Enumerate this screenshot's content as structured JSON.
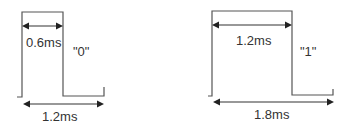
{
  "diagrams": [
    {
      "bit_label": "\"0\"",
      "high_duration_label": "0.6ms",
      "period_label": "1.2ms",
      "high_duration_ms": 0.6,
      "period_ms": 1.2
    },
    {
      "bit_label": "\"1\"",
      "high_duration_label": "1.2ms",
      "period_label": "1.8ms",
      "high_duration_ms": 1.2,
      "period_ms": 1.8
    }
  ],
  "colors": {
    "waveform": "#555555",
    "arrows": "#222222",
    "text": "#333333",
    "background": "#ffffff"
  }
}
